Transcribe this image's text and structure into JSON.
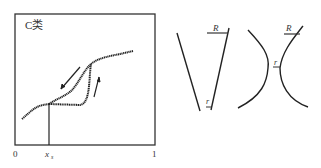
{
  "figure": {
    "panel_label": "C类",
    "x_axis": {
      "ticks": [
        "0",
        "x",
        "1"
      ],
      "xs_label": "x",
      "xs_subscript": "s",
      "xs_value_fraction": 0.24
    },
    "curve": {
      "type": "hysteresis loop (adsorption/desorption)",
      "arrow_upper": "down-left (desorption)",
      "arrow_lower": "up (adsorption)"
    },
    "pore_shapes": [
      {
        "name": "cone-pore",
        "labels": {
          "large_radius": "R",
          "small_radius": "r"
        }
      },
      {
        "name": "hourglass-pore",
        "labels": {
          "large_radius": "R",
          "small_radius": "r"
        }
      }
    ]
  },
  "colors": {
    "line": "#222222",
    "frame": "#333333",
    "text": "#444444"
  }
}
